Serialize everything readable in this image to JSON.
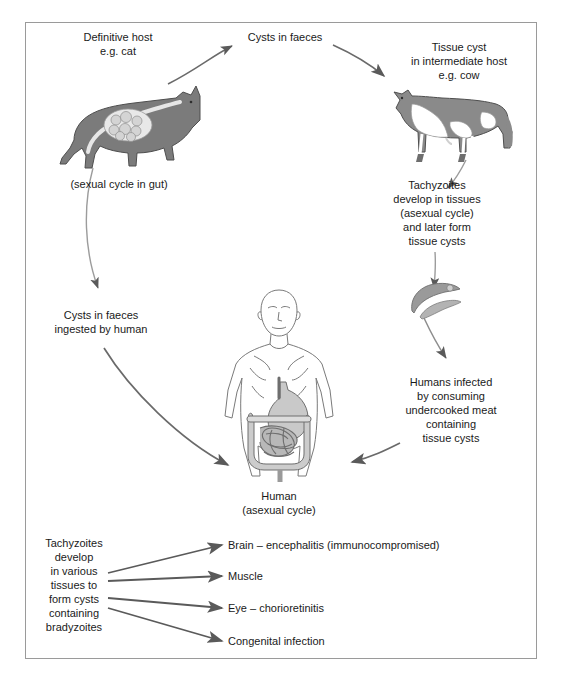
{
  "diagram": {
    "colors": {
      "border": "#9a9a9a",
      "arrow": "#5a5a5a",
      "animal_dark": "#7b7b7b",
      "animal_light": "#d6d6d6",
      "text": "#1a1a1a",
      "background": "#ffffff"
    },
    "labels": {
      "definitive_host": "Definitive host\ne.g. cat",
      "sexual_cycle": "(sexual cycle in gut)",
      "cysts_in_faeces_top": "Cysts in faeces",
      "tissue_cyst_host": "Tissue cyst\nin intermediate host\ne.g. cow",
      "tachyzoites_develop": "Tachyzoites\ndevelop in tissues\n(asexual cycle)\nand later form\ntissue cysts",
      "cysts_ingested": "Cysts in faeces\ningested by human",
      "humans_infected": "Humans infected\nby consuming\nundercooked meat\ncontaining\ntissue cysts",
      "human_label": "Human\n(asexual cycle)",
      "tachyzoites_various": "Tachyzoites\ndevelop\nin various\ntissues to\nform cysts\ncontaining\nbradyzoites"
    },
    "outcomes": [
      "Brain – encephalitis (immunocompromised)",
      "Muscle",
      "Eye – chorioretinitis",
      "Congenital infection"
    ],
    "illustrations": [
      {
        "name": "cat",
        "caption": "Definitive host e.g. cat"
      },
      {
        "name": "cow",
        "caption": "Tissue cyst in intermediate host e.g. cow"
      },
      {
        "name": "tachyzoites",
        "caption": "Crescent-shaped tachyzoites"
      },
      {
        "name": "human-torso",
        "caption": "Human with stomach and intestines"
      }
    ]
  }
}
